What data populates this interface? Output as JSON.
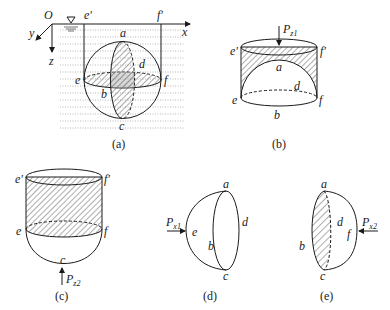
{
  "figure": {
    "panels": [
      {
        "id": "a",
        "caption": "(a)",
        "labels": {
          "origin": "O",
          "x_axis": "x",
          "y_axis": "y",
          "z_axis": "z",
          "e_prime": "e'",
          "f_prime": "f'",
          "a": "a",
          "b": "b",
          "c": "c",
          "d": "d",
          "e": "e",
          "f": "f",
          "free_surface_symbol": "∇"
        }
      },
      {
        "id": "b",
        "caption": "(b)",
        "labels": {
          "force": "P",
          "force_sub": "z1",
          "e_prime": "e'",
          "f_prime": "f'",
          "a": "a",
          "d": "d",
          "e": "e",
          "f": "f",
          "b": "b"
        }
      },
      {
        "id": "c",
        "caption": "(c)",
        "labels": {
          "e_prime": "e'",
          "f_prime": "f'",
          "e": "e",
          "f": "f",
          "c": "c",
          "force": "P",
          "force_sub": "z2"
        }
      },
      {
        "id": "d",
        "caption": "(d)",
        "labels": {
          "force": "P",
          "force_sub": "x1",
          "a": "a",
          "b": "b",
          "c": "c",
          "d": "d",
          "e": "e"
        }
      },
      {
        "id": "e",
        "caption": "(e)",
        "labels": {
          "force": "P",
          "force_sub": "x2",
          "a": "a",
          "b": "b",
          "c": "c",
          "d": "d",
          "f": "f"
        }
      }
    ]
  }
}
